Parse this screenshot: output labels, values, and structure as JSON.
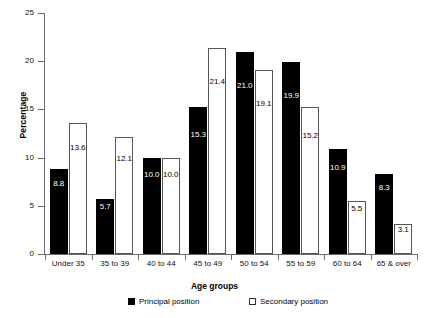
{
  "chart_data": {
    "type": "bar",
    "title": "",
    "xlabel": "Age groups",
    "ylabel": "Percentage",
    "categories": [
      "Under 35",
      "35 to 39",
      "40 to 44",
      "45 to 49",
      "50 to 54",
      "55 to 59",
      "60 to 64",
      "65 & over"
    ],
    "series": [
      {
        "name": "Principal position",
        "color": "#000000",
        "values": [
          8.8,
          5.7,
          10.0,
          15.3,
          21.0,
          19.9,
          10.9,
          8.3
        ],
        "labels": [
          "8.8",
          "5.7",
          "10.0",
          "15.3",
          "21.0",
          "19.9",
          "10.9",
          "8.3"
        ]
      },
      {
        "name": "Secondary position",
        "color": "#ffffff",
        "values": [
          13.6,
          12.1,
          10.0,
          21.4,
          19.1,
          15.2,
          5.5,
          3.1
        ],
        "labels": [
          "13.6",
          "12.1",
          "10.0",
          "21.4",
          "19.1",
          "15.2",
          "5.5",
          "3.1"
        ]
      }
    ],
    "ylim": [
      0,
      25
    ],
    "yticks": [
      0,
      5,
      10,
      15,
      20,
      25
    ],
    "ytick_labels": [
      "0",
      "5",
      "10",
      "15",
      "20",
      "25"
    ],
    "grid": false,
    "legend_position": "bottom"
  },
  "legend": {
    "principal_label": "Principal position",
    "secondary_label": "Secondary position"
  },
  "axes": {
    "y_title": "Percentage",
    "x_title": "Age groups"
  }
}
